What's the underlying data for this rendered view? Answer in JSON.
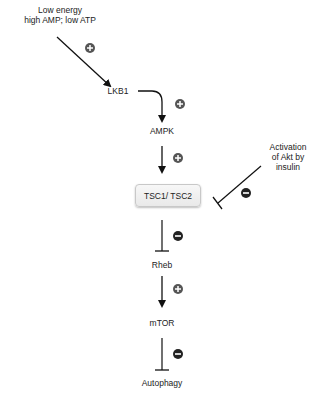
{
  "diagram": {
    "nodes": {
      "energy": {
        "line1": "Low energy",
        "line2": "high AMP; low ATP"
      },
      "lkb1": "LKB1",
      "ampk": "AMPK",
      "tsc": "TSC1/ TSC2",
      "akt": {
        "line1": "Activation",
        "line2": "of Akt by",
        "line3": "insulin"
      },
      "rheb": "Rheb",
      "mtor": "mTOR",
      "autophagy": "Autophagy"
    },
    "edges": [
      {
        "from": "Low energy",
        "to": "LKB1",
        "type": "activation",
        "sign": "+"
      },
      {
        "from": "LKB1",
        "to": "AMPK",
        "type": "activation",
        "sign": "+"
      },
      {
        "from": "AMPK",
        "to": "TSC1/ TSC2",
        "type": "activation",
        "sign": "+"
      },
      {
        "from": "Activation of Akt by insulin",
        "to": "TSC1/ TSC2",
        "type": "inhibition",
        "sign": "-"
      },
      {
        "from": "TSC1/ TSC2",
        "to": "Rheb",
        "type": "inhibition",
        "sign": "-"
      },
      {
        "from": "Rheb",
        "to": "mTOR",
        "type": "activation",
        "sign": "+"
      },
      {
        "from": "mTOR",
        "to": "Autophagy",
        "type": "inhibition",
        "sign": "-"
      }
    ],
    "colors": {
      "line": "#111111",
      "badge": "#555555",
      "box_border": "#c8c8c8",
      "text": "#222222"
    }
  }
}
